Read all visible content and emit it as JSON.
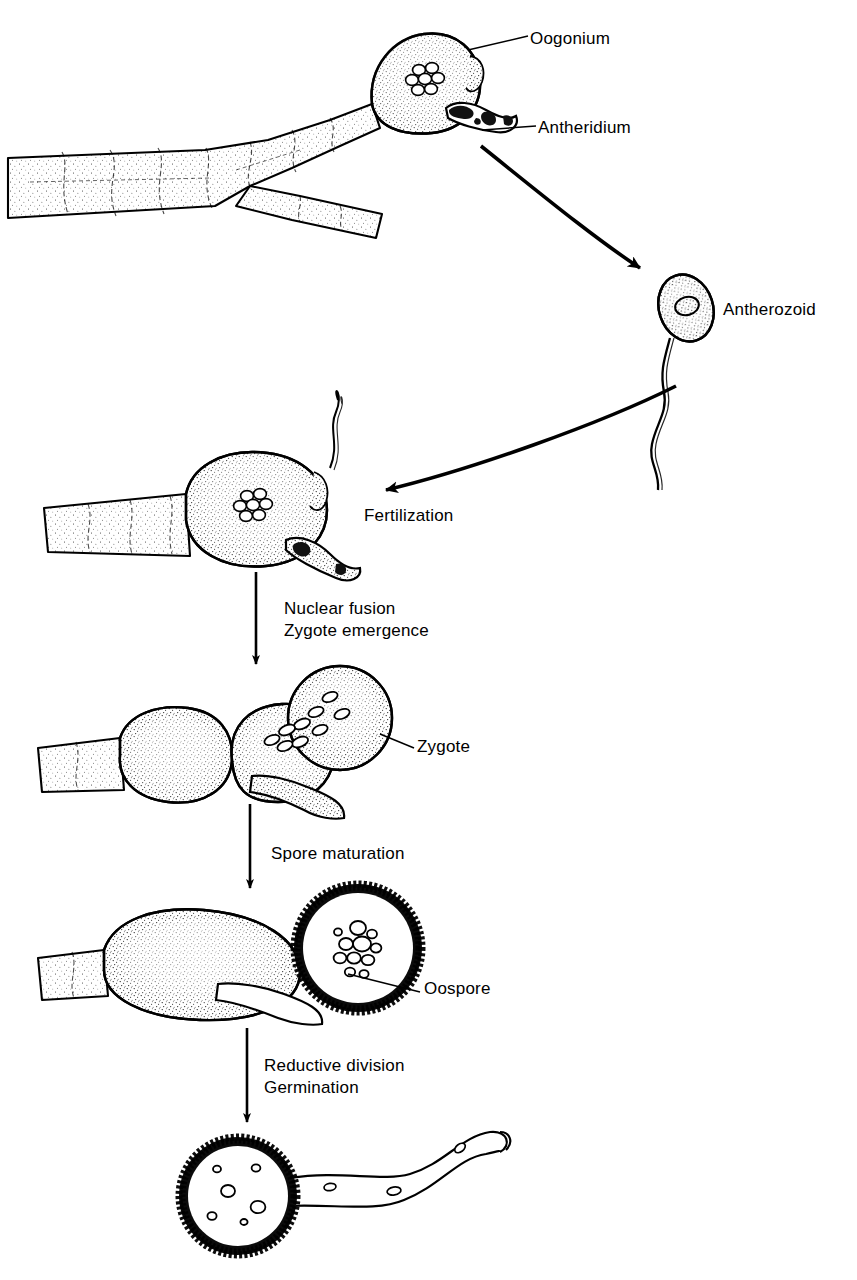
{
  "figure": {
    "background_color": "#ffffff",
    "ink_color": "#000000",
    "width": 857,
    "height": 1280
  },
  "labels": {
    "oogonium": "Oogonium",
    "antheridium": "Antheridium",
    "antherozoid": "Antherozoid",
    "fertilization": "Fertilization",
    "nuclear_fusion": "Nuclear fusion",
    "zygote_emergence": "Zygote emergence",
    "zygote": "Zygote",
    "spore_maturation": "Spore maturation",
    "oospore": "Oospore",
    "reductive_division": "Reductive division",
    "germination": "Germination"
  },
  "stages": [
    {
      "id": "stage-1",
      "name": "Oogonium with antheridium on branched hypha",
      "labels": [
        "Oogonium",
        "Antheridium"
      ]
    },
    {
      "id": "stage-2",
      "name": "Released antherozoid with flagellum",
      "labels": [
        "Antherozoid"
      ]
    },
    {
      "id": "stage-3",
      "name": "Fertilized oogonium",
      "labels": [
        "Fertilization"
      ]
    },
    {
      "id": "stage-4",
      "name": "Zygote emerging from oogonium",
      "labels": [
        "Zygote"
      ]
    },
    {
      "id": "stage-5",
      "name": "Mature thick-walled oospore",
      "labels": [
        "Oospore"
      ]
    },
    {
      "id": "stage-6",
      "name": "Germinating oospore with germ tube",
      "labels": []
    }
  ],
  "transitions": [
    {
      "id": "t1",
      "kind": "curved-arrow",
      "from": "stage-1",
      "to": "stage-2",
      "label": ""
    },
    {
      "id": "t2",
      "kind": "curved-arrow",
      "from": "stage-2",
      "to": "stage-3",
      "label": "Fertilization"
    },
    {
      "id": "t3",
      "kind": "straight-arrow",
      "from": "stage-3",
      "to": "stage-4",
      "label": "Nuclear fusion\nZygote emergence"
    },
    {
      "id": "t4",
      "kind": "straight-arrow",
      "from": "stage-4",
      "to": "stage-5",
      "label": "Spore maturation"
    },
    {
      "id": "t5",
      "kind": "straight-arrow",
      "from": "stage-5",
      "to": "stage-6",
      "label": "Reductive division\nGermination"
    }
  ]
}
